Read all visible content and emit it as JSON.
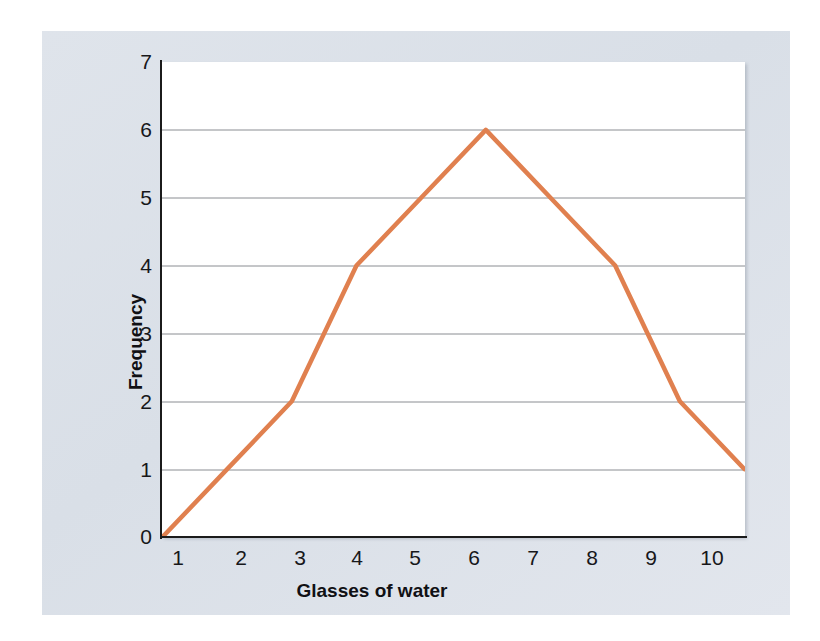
{
  "figure": {
    "panel_background": "#dde2ea",
    "plot_background": "#ffffff",
    "axis_color": "#1b1b1b"
  },
  "chart_data": {
    "type": "line",
    "title": "",
    "subtitle": "",
    "xlabel": "Glasses of water",
    "ylabel": "Frequency",
    "x": [
      1,
      2,
      3,
      4,
      5,
      6,
      7,
      8,
      9,
      10
    ],
    "values": [
      0,
      1,
      2,
      4,
      5,
      6,
      5,
      4,
      2,
      1
    ],
    "series": [
      {
        "name": "Frequency",
        "color": "#e0804f",
        "values": [
          0,
          1,
          2,
          4,
          5,
          6,
          5,
          4,
          2,
          1
        ]
      }
    ],
    "xlim": [
      1,
      10
    ],
    "ylim": [
      0,
      7
    ],
    "xticks": [
      "1",
      "2",
      "3",
      "4",
      "5",
      "6",
      "7",
      "8",
      "9",
      "10"
    ],
    "yticks": [
      "0",
      "1",
      "2",
      "3",
      "4",
      "5",
      "6",
      "7"
    ],
    "grid": "horizontal",
    "gridline_color": "#8a8d92",
    "legend": "none",
    "line_width": 4,
    "markers": "none"
  },
  "axes": {
    "x_title": "Glasses of water",
    "y_title": "Frequency",
    "x_tick_labels": [
      "1",
      "2",
      "3",
      "4",
      "5",
      "6",
      "7",
      "8",
      "9",
      "10"
    ],
    "y_tick_labels": [
      "7",
      "6",
      "5",
      "4",
      "3",
      "2",
      "1",
      "0"
    ]
  }
}
